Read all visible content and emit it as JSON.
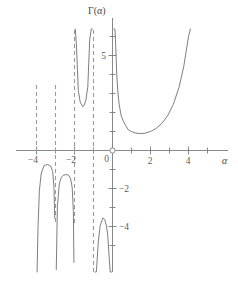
{
  "figure": {
    "y_axis_label": "Γ(α)",
    "x_axis_label": "α",
    "origin_label": "0"
  },
  "chart_data": {
    "type": "line",
    "title": "",
    "subtitle": "",
    "xlabel": "α",
    "ylabel": "Γ(α)",
    "xlim": [
      -4.8,
      5.6
    ],
    "ylim": [
      -5.6,
      6.6
    ],
    "xticks": [
      -4,
      -3,
      -2,
      -1,
      0,
      1,
      2,
      3,
      4,
      5
    ],
    "xtick_labels": [
      "−4",
      "",
      "−2",
      "",
      "0",
      "",
      "2",
      "",
      "4",
      ""
    ],
    "yticks": [
      -5,
      -4,
      -3,
      -2,
      -1,
      1,
      2,
      3,
      4,
      5,
      6
    ],
    "ytick_labels": [
      "",
      "−4",
      "",
      "−2",
      "",
      "",
      "",
      "",
      "",
      "5",
      ""
    ],
    "grid": false,
    "legend": null,
    "annotations": [],
    "asymptotes": {
      "type": "vertical-dashed",
      "x": [
        -4,
        -3,
        -2,
        -1,
        0
      ],
      "note": "poles of the Gamma function at non-positive integers"
    },
    "series": [
      {
        "name": "Γ(α) on (0, 4.1]",
        "x": [
          0.075,
          0.1,
          0.13,
          0.17,
          0.22,
          0.28,
          0.35,
          0.45,
          0.55,
          0.7,
          0.85,
          1.0,
          1.2,
          1.4616,
          1.7,
          2.0,
          2.3,
          2.6,
          2.9,
          3.2,
          3.5,
          3.75,
          4.0,
          4.1
        ],
        "y": [
          12.8,
          9.51,
          7.23,
          5.45,
          4.08,
          3.1,
          2.44,
          1.86,
          1.59,
          1.3,
          1.07,
          1.0,
          0.918,
          0.8856,
          0.909,
          1.0,
          1.166,
          1.429,
          1.827,
          2.424,
          3.323,
          4.422,
          6.0,
          6.81
        ]
      },
      {
        "name": "Γ(α) on (-1, 0)",
        "x": [
          -0.97,
          -0.92,
          -0.85,
          -0.75,
          -0.65,
          -0.55,
          -0.5,
          -0.4046,
          -0.32,
          -0.25,
          -0.18,
          -0.12,
          -0.07,
          -0.04
        ],
        "y": [
          -34.1,
          -13.8,
          -7.6,
          -4.83,
          -3.96,
          -3.68,
          -3.545,
          -3.645,
          -3.96,
          -4.46,
          -5.55,
          -7.65,
          -12.6,
          -21.5
        ]
      },
      {
        "name": "Γ(α) on (-2, -1)",
        "x": [
          -1.96,
          -1.9,
          -1.8,
          -1.7,
          -1.6,
          -1.5734,
          -1.5,
          -1.4,
          -1.3,
          -1.2,
          -1.12,
          -1.06,
          -1.03
        ],
        "y": [
          12.6,
          5.56,
          3.16,
          2.55,
          2.37,
          2.3025,
          2.363,
          2.659,
          3.361,
          5.821,
          9.32,
          17.0,
          33.0
        ]
      },
      {
        "name": "Γ(α) on (-3, -2)",
        "x": [
          -2.96,
          -2.9,
          -2.8,
          -2.7,
          -2.6,
          -2.5,
          -2.45,
          -2.3569,
          -2.3,
          -2.2,
          -2.12,
          -2.06,
          -2.03
        ],
        "y": [
          -6.28,
          -2.93,
          -1.76,
          -1.43,
          -1.31,
          -1.28,
          -1.27,
          -1.2808,
          -1.31,
          -1.5,
          -1.97,
          -3.22,
          -5.89
        ]
      },
      {
        "name": "Γ(α) on (-4, -3)",
        "x": [
          -3.97,
          -3.92,
          -3.85,
          -3.75,
          -3.6,
          -3.4118,
          -3.25,
          -3.15,
          -3.08,
          -3.04
        ],
        "y": [
          -8.82,
          -4.05,
          -2.12,
          -1.19,
          -0.79,
          -0.7355,
          -0.822,
          -1.12,
          -1.94,
          -3.56
        ]
      }
    ]
  }
}
